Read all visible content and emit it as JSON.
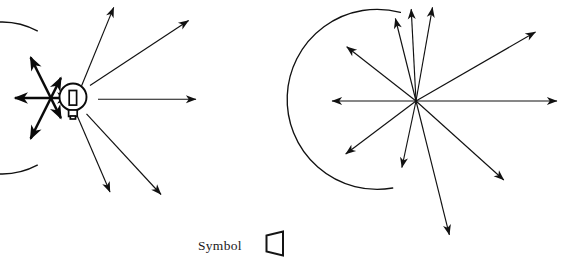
{
  "figure": {
    "background_color": "#ffffff",
    "line_color": "#111111",
    "width": 567,
    "height": 267
  },
  "caption": {
    "label": "Symbol",
    "symbol_name": "lamp-trapezoid-symbol"
  },
  "left_diagram": {
    "name": "reflector-lamp-ray-diagram",
    "center": {
      "x": 73,
      "y": 98
    },
    "lamp": {
      "type": "incandescent-bulb",
      "bulb_radius": 13.5,
      "filament": "rectangular-element",
      "base": "screw-base"
    },
    "reflector": {
      "type": "parabolic-arc",
      "radius": 76,
      "start_angle_deg": 118,
      "end_angle_deg": 242,
      "description": "open-right reflector arc behind lamp"
    },
    "reflected_rays": [
      {
        "name": "ray-upper-left-bidirectional",
        "angle_deg": 137,
        "length": 58,
        "double_headed": true,
        "weight": "thick"
      },
      {
        "name": "ray-left-bidirectional",
        "angle_deg": 180,
        "length": 58,
        "double_headed": true,
        "weight": "thick"
      },
      {
        "name": "ray-lower-left-bidirectional",
        "angle_deg": 223,
        "length": 58,
        "double_headed": true,
        "weight": "thick"
      }
    ],
    "emitted_rays": [
      {
        "name": "ray-up-right-steep",
        "angle_deg": 66,
        "length": 100,
        "double_headed": false,
        "weight": "thin"
      },
      {
        "name": "ray-up-right-shallow",
        "angle_deg": 38,
        "length": 128,
        "double_headed": false,
        "weight": "thin"
      },
      {
        "name": "ray-horizontal-right",
        "angle_deg": 0,
        "length": 124,
        "double_headed": false,
        "weight": "thin"
      },
      {
        "name": "ray-down-right-shallow",
        "angle_deg": -40,
        "length": 125,
        "double_headed": false,
        "weight": "thin"
      },
      {
        "name": "ray-down-right-steep",
        "angle_deg": -72,
        "length": 90,
        "double_headed": false,
        "weight": "thin"
      }
    ]
  },
  "right_diagram": {
    "name": "polar-light-distribution-diagram",
    "center": {
      "x": 416,
      "y": 101
    },
    "reflector": {
      "type": "circular-arc",
      "radius": 90,
      "start_angle_deg": 100,
      "end_angle_deg": 255,
      "description": "open-right arc enclosing the left hemisphere"
    },
    "rays": [
      {
        "name": "ray-vertical-up-left",
        "angle_deg": 104,
        "length": 85,
        "double_headed": false
      },
      {
        "name": "ray-vertical-up-center",
        "angle_deg": 93,
        "length": 92,
        "double_headed": false
      },
      {
        "name": "ray-vertical-up-right",
        "angle_deg": 80,
        "length": 95,
        "double_headed": false
      },
      {
        "name": "ray-up-left-diagonal",
        "angle_deg": 142,
        "length": 88,
        "double_headed": false
      },
      {
        "name": "ray-horizontal-left",
        "angle_deg": 180,
        "length": 84,
        "double_headed": false
      },
      {
        "name": "ray-down-left-diagonal",
        "angle_deg": 217,
        "length": 88,
        "double_headed": false
      },
      {
        "name": "ray-down-steep-left",
        "angle_deg": 258,
        "length": 68,
        "double_headed": false
      },
      {
        "name": "ray-down-long-center",
        "angle_deg": 284,
        "length": 138,
        "double_headed": false
      },
      {
        "name": "ray-down-right-diagonal",
        "angle_deg": 318,
        "length": 118,
        "double_headed": false
      },
      {
        "name": "ray-horizontal-right",
        "angle_deg": 0,
        "length": 141,
        "double_headed": false
      },
      {
        "name": "ray-up-right-diagonal",
        "angle_deg": 30,
        "length": 138,
        "double_headed": false
      }
    ]
  }
}
